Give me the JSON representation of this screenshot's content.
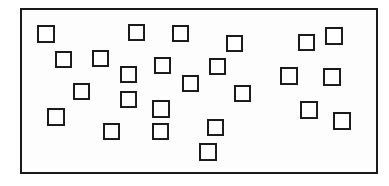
{
  "figure": {
    "type": "diagram",
    "canvas": {
      "width": 389,
      "height": 186
    },
    "background_color": "#ffffff",
    "ink_color": "#1a1a1a",
    "frame": {
      "label": "outer-rectangle",
      "x": 20,
      "y": 8,
      "width": 358,
      "height": 166,
      "border_width": 2,
      "border_color": "#1a1a1a",
      "fill_color": "#fdfdfd"
    },
    "square_style": {
      "border_width": 2,
      "border_color": "#1a1a1a",
      "fill_color": "#ffffff",
      "nominal_size": 17
    },
    "square_count": 25,
    "squares": [
      {
        "id": 1,
        "x": 37,
        "y": 25,
        "size": 18
      },
      {
        "id": 2,
        "x": 128,
        "y": 24,
        "size": 17
      },
      {
        "id": 3,
        "x": 172,
        "y": 25,
        "size": 17
      },
      {
        "id": 4,
        "x": 226,
        "y": 35,
        "size": 17
      },
      {
        "id": 5,
        "x": 298,
        "y": 34,
        "size": 17
      },
      {
        "id": 6,
        "x": 325,
        "y": 27,
        "size": 18
      },
      {
        "id": 7,
        "x": 55,
        "y": 51,
        "size": 17
      },
      {
        "id": 8,
        "x": 92,
        "y": 50,
        "size": 17
      },
      {
        "id": 9,
        "x": 120,
        "y": 66,
        "size": 17
      },
      {
        "id": 10,
        "x": 154,
        "y": 57,
        "size": 17
      },
      {
        "id": 11,
        "x": 209,
        "y": 58,
        "size": 17
      },
      {
        "id": 12,
        "x": 280,
        "y": 67,
        "size": 18
      },
      {
        "id": 13,
        "x": 323,
        "y": 68,
        "size": 18
      },
      {
        "id": 14,
        "x": 73,
        "y": 83,
        "size": 17
      },
      {
        "id": 15,
        "x": 182,
        "y": 75,
        "size": 17
      },
      {
        "id": 16,
        "x": 120,
        "y": 91,
        "size": 17
      },
      {
        "id": 17,
        "x": 234,
        "y": 85,
        "size": 17
      },
      {
        "id": 18,
        "x": 47,
        "y": 108,
        "size": 18
      },
      {
        "id": 19,
        "x": 152,
        "y": 100,
        "size": 18
      },
      {
        "id": 20,
        "x": 300,
        "y": 101,
        "size": 18
      },
      {
        "id": 21,
        "x": 333,
        "y": 112,
        "size": 18
      },
      {
        "id": 22,
        "x": 103,
        "y": 123,
        "size": 17
      },
      {
        "id": 23,
        "x": 152,
        "y": 123,
        "size": 17
      },
      {
        "id": 24,
        "x": 207,
        "y": 119,
        "size": 17
      },
      {
        "id": 25,
        "x": 199,
        "y": 143,
        "size": 18
      }
    ]
  }
}
